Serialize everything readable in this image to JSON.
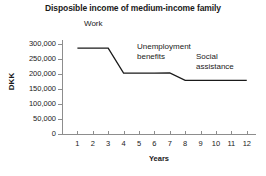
{
  "chart_data": {
    "type": "line",
    "title": "Disposible income of medium-income family",
    "xlabel": "Years",
    "ylabel": "DKK",
    "xlim": [
      0,
      12.6
    ],
    "ylim": [
      0,
      312000
    ],
    "grid": false,
    "legend": "none",
    "x": [
      1,
      2,
      3,
      4,
      5,
      6,
      7,
      8,
      9,
      10,
      11,
      12
    ],
    "xtick_labels": [
      "1",
      "2",
      "3",
      "4",
      "5",
      "6",
      "7",
      "8",
      "9",
      "10",
      "11",
      "12"
    ],
    "ytick_values": [
      0,
      50000,
      100000,
      150000,
      200000,
      250000,
      300000
    ],
    "ytick_labels": [
      "0",
      "50,000",
      "100,000",
      "150,000",
      "200,000",
      "250,000",
      "300,000"
    ],
    "series": [
      {
        "name": "Disposible income",
        "color": "#1a1a1a",
        "values": [
          285000,
          285000,
          285000,
          202000,
          202000,
          202000,
          203000,
          178000,
          178000,
          178000,
          178000,
          178000
        ]
      }
    ],
    "annotations": [
      {
        "text": "Work",
        "x": 2.0,
        "y": 305000
      },
      {
        "text": "Unemployment\nbenefits",
        "x": 5.2,
        "y": 268000
      },
      {
        "text": "Social\nassistance",
        "x": 8.8,
        "y": 248000
      }
    ]
  },
  "colors": {
    "line": "#1a1a1a",
    "axis": "#8d8d8d",
    "background": "#ffffff",
    "text": "#1a1a1a"
  }
}
